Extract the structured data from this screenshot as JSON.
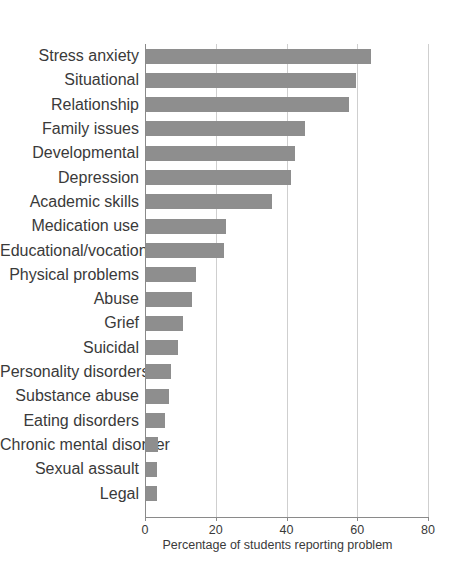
{
  "figure": {
    "corner_artifact": "",
    "background_color": "#ffffff",
    "bar_color": "#8e8e8e",
    "gridline_color": "#cfcfcf",
    "axis_color": "#8a8a8a",
    "text_color": "#3a3a3a"
  },
  "chart_data": {
    "type": "bar",
    "orientation": "horizontal",
    "title": "",
    "subtitle": "",
    "xlabel": "Percentage of students reporting problem",
    "ylabel": "",
    "xlim": [
      0,
      80
    ],
    "xticks": [
      0,
      20,
      40,
      60,
      80
    ],
    "xtick_labels": [
      "0",
      "20",
      "40",
      "60",
      "80"
    ],
    "grid": true,
    "grid_axis": "x",
    "legend": false,
    "legend_position": "none",
    "categories": [
      "Stress anxiety",
      "Situational",
      "Relationship",
      "Family issues",
      "Developmental",
      "Depression",
      "Academic skills",
      "Medication use",
      "Educational/vocational",
      "Physical problems",
      "Abuse",
      "Grief",
      "Suicidal",
      "Personality disorders",
      "Substance abuse",
      "Eating disorders",
      "Chronic mental disorder",
      "Sexual assault",
      "Legal"
    ],
    "values": [
      63.5,
      59.5,
      57.5,
      45.0,
      42.0,
      41.0,
      35.5,
      22.5,
      22.0,
      14.0,
      13.0,
      10.5,
      9.0,
      7.0,
      6.5,
      5.5,
      3.5,
      3.2,
      3.0
    ]
  }
}
